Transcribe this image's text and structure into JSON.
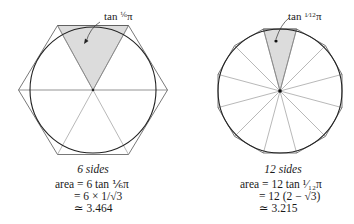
{
  "left_figure": {
    "sides": 6,
    "label": "tan ⅙π",
    "label_parts": {
      "prefix": "tan ",
      "frac": "⅙",
      "suffix": "π"
    },
    "caption": "6 sides",
    "formula": {
      "line1": "area = 6 tan ⅙π",
      "line2": "= 6 × 1/√3",
      "line3": "≃ 3.464"
    }
  },
  "right_figure": {
    "sides": 12,
    "label_parts": {
      "prefix": "tan ",
      "frac": "1⁄12",
      "suffix": "π"
    },
    "caption": "12 sides",
    "formula": {
      "line1": "area = 12 tan ¹⁄₁₂π",
      "line2": "= 12 (2 − √3)",
      "line3": "≃ 3.215"
    }
  },
  "colors": {
    "stroke": "#2a2a2a",
    "thin": "#777777",
    "shade": "#d9d9d9"
  }
}
